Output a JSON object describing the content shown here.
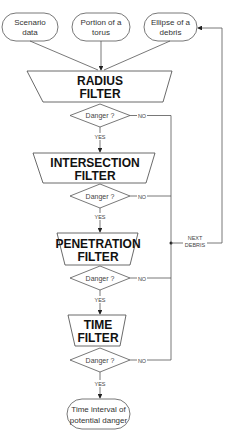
{
  "inputs": [
    {
      "line1": "Scenario",
      "line2": "data"
    },
    {
      "line1": "Portion of a",
      "line2": "torus"
    },
    {
      "line1": "Ellipse of a",
      "line2": "debris"
    }
  ],
  "filters": [
    {
      "line1": "RADIUS",
      "line2": "FILTER"
    },
    {
      "line1": "INTERSECTION",
      "line2": "FILTER"
    },
    {
      "line1": "PENETRATION",
      "line2": "FILTER"
    },
    {
      "line1": "TIME",
      "line2": "FILTER"
    }
  ],
  "decision": {
    "label": "Danger ?",
    "yes": "YES",
    "no": "NO"
  },
  "loop": {
    "line1": "NEXT",
    "line2": "DEBRIS"
  },
  "output": {
    "line1": "Time interval of",
    "line2": "potential danger"
  }
}
